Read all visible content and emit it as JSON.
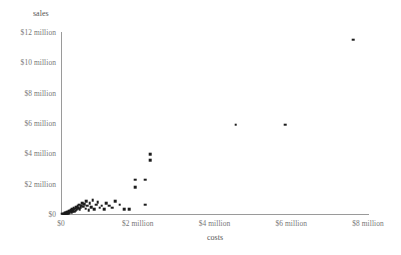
{
  "chart_data": {
    "type": "scatter",
    "title": "",
    "xlabel": "costs",
    "ylabel": "sales",
    "xlim": [
      0,
      8000000
    ],
    "ylim": [
      0,
      12000000
    ],
    "grid": false,
    "legend": "none",
    "x_tick_labels": [
      "$0",
      "$2 million",
      "$4 million",
      "$6 million",
      "$8 million"
    ],
    "x_tick_values": [
      0,
      2000000,
      4000000,
      6000000,
      8000000
    ],
    "y_tick_labels": [
      "$0",
      "$2 million",
      "$4 million",
      "$6 million",
      "$8 million",
      "$10 million",
      "$12 million"
    ],
    "y_tick_values": [
      0,
      2000000,
      4000000,
      6000000,
      8000000,
      10000000,
      12000000
    ],
    "marker": "square",
    "marker_color": "#1c1c1c",
    "axis_color": "#9a9a9a",
    "points": [
      [
        30000,
        20000
      ],
      [
        55000,
        30000
      ],
      [
        80000,
        25000
      ],
      [
        95000,
        60000
      ],
      [
        110000,
        45000
      ],
      [
        120000,
        90000
      ],
      [
        140000,
        35000
      ],
      [
        150000,
        110000
      ],
      [
        165000,
        70000
      ],
      [
        175000,
        150000
      ],
      [
        190000,
        55000
      ],
      [
        205000,
        130000
      ],
      [
        215000,
        210000
      ],
      [
        230000,
        95000
      ],
      [
        245000,
        175000
      ],
      [
        260000,
        250000
      ],
      [
        275000,
        120000
      ],
      [
        290000,
        300000
      ],
      [
        305000,
        190000
      ],
      [
        320000,
        260000
      ],
      [
        335000,
        400000
      ],
      [
        350000,
        150000
      ],
      [
        365000,
        340000
      ],
      [
        380000,
        230000
      ],
      [
        395000,
        460000
      ],
      [
        410000,
        290000
      ],
      [
        430000,
        520000
      ],
      [
        450000,
        380000
      ],
      [
        470000,
        610000
      ],
      [
        490000,
        300000
      ],
      [
        510000,
        430000
      ],
      [
        530000,
        560000
      ],
      [
        560000,
        720000
      ],
      [
        580000,
        470000
      ],
      [
        610000,
        640000
      ],
      [
        640000,
        350000
      ],
      [
        660000,
        830000
      ],
      [
        690000,
        560000
      ],
      [
        720000,
        240000
      ],
      [
        750000,
        700000
      ],
      [
        790000,
        460000
      ],
      [
        830000,
        900000
      ],
      [
        870000,
        300000
      ],
      [
        910000,
        620000
      ],
      [
        960000,
        780000
      ],
      [
        1010000,
        420000
      ],
      [
        1060000,
        560000
      ],
      [
        1120000,
        330000
      ],
      [
        1180000,
        700000
      ],
      [
        1250000,
        560000
      ],
      [
        1330000,
        420000
      ],
      [
        1420000,
        860000
      ],
      [
        1530000,
        620000
      ],
      [
        1650000,
        330000
      ],
      [
        1780000,
        300000
      ],
      [
        1930000,
        2250000
      ],
      [
        1930000,
        1750000
      ],
      [
        2200000,
        2250000
      ],
      [
        2200000,
        620000
      ],
      [
        2320000,
        3950000
      ],
      [
        2320000,
        3550000
      ],
      [
        4550000,
        5900000
      ],
      [
        5850000,
        5900000
      ],
      [
        7620000,
        11500000
      ]
    ]
  },
  "edge_text": {
    "top": "",
    "bottom": ""
  }
}
